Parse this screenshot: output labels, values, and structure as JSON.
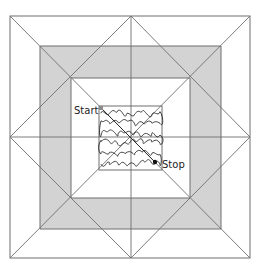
{
  "diagram": {
    "labels": {
      "start": "Start",
      "stop": "Stop"
    },
    "colors": {
      "background": "#ffffff",
      "band_fill": "#d3d3d3",
      "line": "#6e6e6e",
      "meander": "#1a1a1a",
      "text": "#222222"
    },
    "parts": [
      {
        "name": "outer-border",
        "description": "Outer white border square"
      },
      {
        "name": "gray-band",
        "description": "Gray square frame band"
      },
      {
        "name": "inner-white-frame",
        "description": "Inner white frame"
      },
      {
        "name": "center-square",
        "description": "Center square with meander (stipple) quilting"
      },
      {
        "name": "diagonals",
        "description": "Corner-to-corner diagonal seam lines"
      },
      {
        "name": "center-cross",
        "description": "Horizontal and vertical center seam lines"
      },
      {
        "name": "diamond",
        "description": "Square-on-point lines joining side midpoints"
      },
      {
        "name": "stitch-path",
        "description": "Straight diagonal travel line from Start to Stop"
      }
    ]
  }
}
